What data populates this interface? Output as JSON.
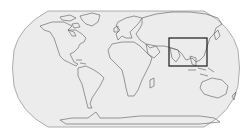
{
  "map": {
    "projection": "robinson",
    "colors": {
      "background": "#ffffff",
      "ocean_land_fill": "#ececec",
      "outline": "#9a9a9a",
      "coastline": "#6f6f6f",
      "highlight_box": "#1a1a1a"
    },
    "highlight_region": {
      "label": "South & East Asia extent",
      "x": 169,
      "y": 38,
      "width": 38,
      "height": 28
    }
  }
}
